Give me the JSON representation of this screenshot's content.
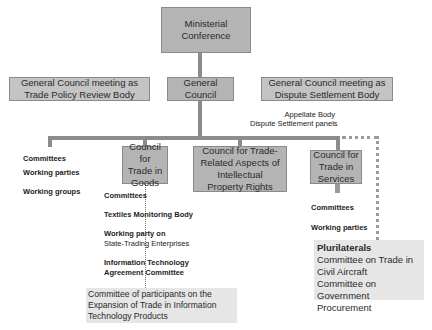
{
  "nodes": {
    "ministerial": {
      "line1": "Ministerial",
      "line2": "Conference"
    },
    "general_council": {
      "line1": "General",
      "line2": "Council"
    },
    "tprb": {
      "line1": "General Council meeting as",
      "line2": "Trade Policy Review Body"
    },
    "dsb": {
      "line1": "General Council meeting as",
      "line2": "Dispute Settlement Body"
    },
    "dsb_sub": {
      "line1": "Appellate Body",
      "line2": "Dispute Settlement panels"
    },
    "goods": {
      "line1": "Council for",
      "line2": "Trade in",
      "line3": "Goods"
    },
    "trips": {
      "line1": "Council for Trade-",
      "line2": "Related Aspects of",
      "line3": "Intellectual",
      "line4": "Property Rights"
    },
    "services": {
      "line1": "Council for",
      "line2": "Trade in",
      "line3": "Services"
    }
  },
  "gc_subsidiaries": [
    "Committees",
    "Working parties",
    "Working groups"
  ],
  "goods_subsidiaries": {
    "committees": "Committees",
    "textiles": "Textiles Monitoring Body",
    "wp_line1": "Working party on",
    "wp_line2": "State-Trading Enterprises",
    "ita_line1": "Information Technology",
    "ita_line2": "Agreement Committee"
  },
  "ita_committee": {
    "line1": "Committee of participants on the",
    "line2": "Expansion of Trade in Information",
    "line3": "Technology Products"
  },
  "services_subsidiaries": [
    "Committees",
    "Working parties"
  ],
  "plurilaterals": {
    "title": "Plurilaterals",
    "line1": "Committee on Trade in",
    "line2": "Civil Aircraft",
    "line3": "Committee on",
    "line4": "Government Procurement"
  }
}
